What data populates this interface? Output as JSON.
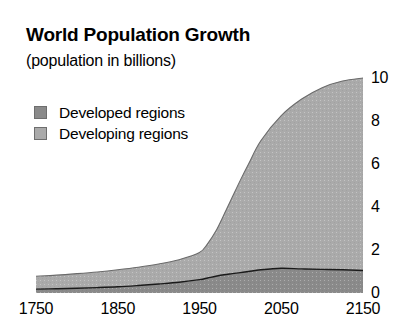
{
  "chart_data": {
    "type": "area",
    "title": "World Population Growth",
    "subtitle": "(population in billions)",
    "xlabel": "",
    "ylabel": "",
    "stacked": true,
    "grid": false,
    "legend_position": "top-left",
    "xlim": [
      1750,
      2150
    ],
    "ylim": [
      0,
      10
    ],
    "x_tick_labels": [
      "1750",
      "1850",
      "1950",
      "2050",
      "2150"
    ],
    "x_ticks": [
      1750,
      1850,
      1950,
      2050,
      2150
    ],
    "y_tick_labels": [
      "0",
      "2",
      "4",
      "6",
      "8",
      "10"
    ],
    "y_ticks": [
      0,
      2,
      4,
      6,
      8,
      10
    ],
    "x": [
      1750,
      1775,
      1800,
      1825,
      1850,
      1875,
      1900,
      1925,
      1950,
      1960,
      1970,
      1980,
      1990,
      2000,
      2010,
      2025,
      2050,
      2075,
      2100,
      2125,
      2150
    ],
    "series": [
      {
        "name": "Developed regions",
        "color": "#8a8a8a",
        "values": [
          0.18,
          0.2,
          0.22,
          0.25,
          0.29,
          0.35,
          0.42,
          0.5,
          0.62,
          0.7,
          0.78,
          0.85,
          0.9,
          0.95,
          1.0,
          1.08,
          1.15,
          1.12,
          1.1,
          1.08,
          1.05
        ]
      },
      {
        "name": "Developing regions",
        "color": "#aaaaaa",
        "values": [
          0.6,
          0.63,
          0.68,
          0.73,
          0.79,
          0.85,
          0.93,
          1.05,
          1.26,
          1.6,
          2.1,
          2.8,
          3.55,
          4.3,
          5.0,
          6.0,
          7.1,
          7.9,
          8.45,
          8.78,
          8.95
        ]
      }
    ],
    "legend": [
      {
        "label": "Developed regions",
        "color": "#8a8a8a"
      },
      {
        "label": "Developing regions",
        "color": "#aaaaaa"
      }
    ]
  }
}
